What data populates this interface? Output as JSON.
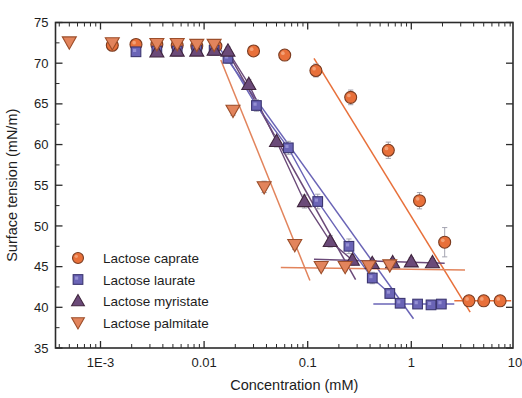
{
  "chart_data": {
    "type": "scatter",
    "title": "",
    "xlabel": "Concentration (mM)",
    "ylabel": "Surface tension (mN/m)",
    "xscale": "log",
    "xlim": [
      0.0004,
      10
    ],
    "ylim": [
      35,
      75
    ],
    "yticks": [
      35,
      40,
      45,
      50,
      55,
      60,
      65,
      70,
      75
    ],
    "xticks": [
      0.001,
      0.01,
      0.1,
      1,
      10
    ],
    "xticklabels": [
      "1E-3",
      "0.01",
      "0.1",
      "1",
      "10"
    ],
    "grid": false,
    "legend_position": "lower-left-inside",
    "colors": {
      "caprate": "#E8703A",
      "laurate": "#6A64B6",
      "myristate": "#6B4A79",
      "palmitate": "#E2845C",
      "errorbar": "#9a9aa8",
      "axis": "#2b2b2b"
    },
    "series": [
      {
        "name": "Lactose caprate",
        "marker": "circle",
        "color": "#E8703A",
        "points": [
          {
            "x": 0.0013,
            "y": 72.2,
            "err": 0.5
          },
          {
            "x": 0.0022,
            "y": 72.3,
            "err": 0.5
          },
          {
            "x": 0.0035,
            "y": 72.3,
            "err": 0.5
          },
          {
            "x": 0.0055,
            "y": 72.2,
            "err": 0.5
          },
          {
            "x": 0.0085,
            "y": 72.1,
            "err": 0.5
          },
          {
            "x": 0.013,
            "y": 72.1,
            "err": 0.5
          },
          {
            "x": 0.03,
            "y": 71.5,
            "err": 0.4
          },
          {
            "x": 0.06,
            "y": 71.0,
            "err": 0.4
          },
          {
            "x": 0.12,
            "y": 69.1,
            "err": 0.8
          },
          {
            "x": 0.26,
            "y": 65.8,
            "err": 0.9
          },
          {
            "x": 0.6,
            "y": 59.3,
            "err": 1.0
          },
          {
            "x": 1.2,
            "y": 53.1,
            "err": 1.0
          },
          {
            "x": 2.1,
            "y": 48.0,
            "err": 1.8
          },
          {
            "x": 3.6,
            "y": 40.8,
            "err": 0.4
          },
          {
            "x": 5.0,
            "y": 40.8,
            "err": 0.4
          },
          {
            "x": 7.2,
            "y": 40.8,
            "err": 0.4
          }
        ],
        "fit_lines": [
          {
            "x1": 0.115,
            "y1": 70.6,
            "x2": 3.7,
            "y2": 39.4
          },
          {
            "x1": 2.6,
            "y1": 40.8,
            "x2": 9.2,
            "y2": 40.8
          }
        ]
      },
      {
        "name": "Lactose laurate",
        "marker": "square",
        "color": "#6A64B6",
        "points": [
          {
            "x": 0.0022,
            "y": 71.4,
            "err": 0.5
          },
          {
            "x": 0.0035,
            "y": 71.5,
            "err": 0.5
          },
          {
            "x": 0.0055,
            "y": 71.5,
            "err": 0.5
          },
          {
            "x": 0.0085,
            "y": 71.6,
            "err": 0.5
          },
          {
            "x": 0.0125,
            "y": 71.6,
            "err": 0.5
          },
          {
            "x": 0.017,
            "y": 70.6,
            "err": 0.6
          },
          {
            "x": 0.032,
            "y": 64.8,
            "err": 0.7
          },
          {
            "x": 0.065,
            "y": 59.6,
            "err": 0.8
          },
          {
            "x": 0.125,
            "y": 53.0,
            "err": 0.9
          },
          {
            "x": 0.25,
            "y": 47.5,
            "err": 0.9
          },
          {
            "x": 0.42,
            "y": 43.6,
            "err": 0.7
          },
          {
            "x": 0.62,
            "y": 41.7,
            "err": 0.6
          },
          {
            "x": 0.78,
            "y": 40.5,
            "err": 0.4
          },
          {
            "x": 1.15,
            "y": 40.4,
            "err": 0.4
          },
          {
            "x": 1.55,
            "y": 40.3,
            "err": 0.4
          },
          {
            "x": 1.95,
            "y": 40.4,
            "err": 0.4
          }
        ],
        "fit_lines": [
          {
            "x1": 0.0145,
            "y1": 71.6,
            "x2": 1.05,
            "y2": 38.6
          },
          {
            "x1": 0.43,
            "y1": 40.4,
            "x2": 2.6,
            "y2": 40.4
          }
        ]
      },
      {
        "name": "Lactose myristate",
        "marker": "triangle-up",
        "color": "#6B4A79",
        "points": [
          {
            "x": 0.0035,
            "y": 71.4,
            "err": 0.5
          },
          {
            "x": 0.0055,
            "y": 71.5,
            "err": 0.5
          },
          {
            "x": 0.0085,
            "y": 71.5,
            "err": 0.5
          },
          {
            "x": 0.0125,
            "y": 71.6,
            "err": 0.5
          },
          {
            "x": 0.017,
            "y": 71.5,
            "err": 0.5
          },
          {
            "x": 0.027,
            "y": 67.4,
            "err": 0.6
          },
          {
            "x": 0.05,
            "y": 60.4,
            "err": 0.7
          },
          {
            "x": 0.093,
            "y": 53.0,
            "err": 0.8
          },
          {
            "x": 0.165,
            "y": 48.1,
            "err": 0.7
          },
          {
            "x": 0.27,
            "y": 45.8,
            "err": 0.6
          },
          {
            "x": 0.42,
            "y": 45.4,
            "err": 0.5
          },
          {
            "x": 0.66,
            "y": 45.5,
            "err": 0.5
          },
          {
            "x": 1.0,
            "y": 45.6,
            "err": 0.5
          },
          {
            "x": 1.6,
            "y": 45.5,
            "err": 0.5
          }
        ],
        "fit_lines": [
          {
            "x1": 0.0165,
            "y1": 71.6,
            "x2": 0.29,
            "y2": 43.4
          },
          {
            "x1": 0.115,
            "y1": 45.9,
            "x2": 2.1,
            "y2": 45.4
          }
        ]
      },
      {
        "name": "Lactose palmitate",
        "marker": "triangle-down",
        "color": "#E2845C",
        "points": [
          {
            "x": 0.0005,
            "y": 72.6,
            "err": 0.4
          },
          {
            "x": 0.0013,
            "y": 72.5,
            "err": 0.4
          },
          {
            "x": 0.0035,
            "y": 72.4,
            "err": 0.4
          },
          {
            "x": 0.0055,
            "y": 72.4,
            "err": 0.4
          },
          {
            "x": 0.0085,
            "y": 72.3,
            "err": 0.4
          },
          {
            "x": 0.0125,
            "y": 72.3,
            "err": 0.4
          },
          {
            "x": 0.019,
            "y": 64.2,
            "err": 0.6
          },
          {
            "x": 0.038,
            "y": 54.8,
            "err": 0.7
          },
          {
            "x": 0.075,
            "y": 47.7,
            "err": 0.6
          },
          {
            "x": 0.135,
            "y": 45.0,
            "err": 0.5
          },
          {
            "x": 0.23,
            "y": 45.0,
            "err": 0.5
          },
          {
            "x": 0.39,
            "y": 45.1,
            "err": 0.5
          },
          {
            "x": 0.62,
            "y": 45.2,
            "err": 0.5
          }
        ],
        "fit_lines": [
          {
            "x1": 0.0145,
            "y1": 70.4,
            "x2": 0.105,
            "y2": 43.3
          },
          {
            "x1": 0.055,
            "y1": 44.9,
            "x2": 3.3,
            "y2": 44.6
          }
        ]
      }
    ],
    "legend": [
      {
        "label": "Lactose caprate",
        "marker": "circle",
        "color": "#E8703A"
      },
      {
        "label": "Lactose laurate",
        "marker": "square",
        "color": "#6A64B6"
      },
      {
        "label": "Lactose myristate",
        "marker": "triangle-up",
        "color": "#6B4A79"
      },
      {
        "label": "Lactose palmitate",
        "marker": "triangle-down",
        "color": "#E2845C"
      }
    ]
  },
  "axes": {
    "x_title": "Concentration (mM)",
    "y_title": "Surface tension (mN/m)",
    "x_tick_labels": [
      "1E-3",
      "0.01",
      "0.1",
      "1",
      "10"
    ],
    "y_tick_labels": [
      "35",
      "40",
      "45",
      "50",
      "55",
      "60",
      "65",
      "70",
      "75"
    ]
  }
}
